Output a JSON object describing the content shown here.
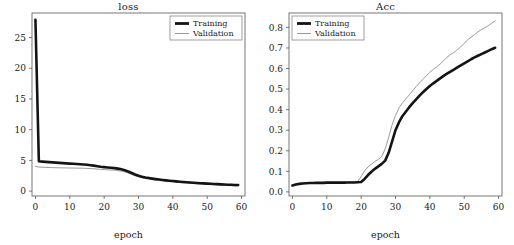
{
  "figure": {
    "width": 514,
    "height": 245,
    "background": "#ffffff",
    "panels": 2
  },
  "colors": {
    "training": "#141414",
    "validation": "#8e8e8e",
    "frame": "#555555",
    "text": "#1a1a1a",
    "background": "#ffffff"
  },
  "legend": {
    "training_label": "Training",
    "validation_label": "Validation"
  },
  "chart_data": [
    {
      "type": "line",
      "title": "loss",
      "xlabel": "epoch",
      "ylabel": "",
      "xlim": [
        -1,
        61
      ],
      "ylim": [
        -0.8,
        29
      ],
      "grid": false,
      "legend_position": "top-right",
      "xticks": [
        0,
        10,
        20,
        30,
        40,
        50,
        60
      ],
      "xticklabels": [
        "0",
        "10",
        "20",
        "30",
        "40",
        "50",
        "60"
      ],
      "yticks": [
        0,
        5,
        10,
        15,
        20,
        25
      ],
      "yticklabels": [
        "0",
        "5",
        "10",
        "15",
        "20",
        "25"
      ],
      "x": [
        0,
        1,
        2,
        3,
        4,
        5,
        6,
        7,
        8,
        9,
        10,
        11,
        12,
        13,
        14,
        15,
        16,
        17,
        18,
        19,
        20,
        21,
        22,
        23,
        24,
        25,
        26,
        27,
        28,
        29,
        30,
        31,
        32,
        33,
        34,
        35,
        36,
        37,
        38,
        39,
        40,
        41,
        42,
        43,
        44,
        45,
        46,
        47,
        48,
        49,
        50,
        51,
        52,
        53,
        54,
        55,
        56,
        57,
        58,
        59
      ],
      "series": [
        {
          "name": "Training",
          "color": "#141414",
          "values": [
            27.9,
            4.85,
            4.8,
            4.76,
            4.72,
            4.68,
            4.64,
            4.6,
            4.56,
            4.52,
            4.48,
            4.44,
            4.4,
            4.36,
            4.32,
            4.28,
            4.22,
            4.15,
            4.05,
            3.95,
            3.9,
            3.85,
            3.8,
            3.74,
            3.66,
            3.55,
            3.4,
            3.2,
            2.95,
            2.7,
            2.5,
            2.34,
            2.22,
            2.12,
            2.03,
            1.95,
            1.88,
            1.81,
            1.75,
            1.69,
            1.63,
            1.58,
            1.53,
            1.48,
            1.44,
            1.4,
            1.36,
            1.32,
            1.28,
            1.25,
            1.22,
            1.19,
            1.16,
            1.13,
            1.1,
            1.07,
            1.04,
            1.02,
            1.0,
            0.98
          ]
        },
        {
          "name": "Validation",
          "color": "#8e8e8e",
          "values": [
            4.0,
            3.92,
            3.88,
            3.86,
            3.84,
            3.82,
            3.8,
            3.79,
            3.78,
            3.77,
            3.76,
            3.75,
            3.74,
            3.73,
            3.72,
            3.7,
            3.67,
            3.63,
            3.58,
            3.53,
            3.5,
            3.47,
            3.44,
            3.4,
            3.34,
            3.25,
            3.12,
            2.94,
            2.72,
            2.5,
            2.32,
            2.17,
            2.06,
            1.96,
            1.88,
            1.8,
            1.73,
            1.67,
            1.61,
            1.55,
            1.5,
            1.45,
            1.4,
            1.35,
            1.31,
            1.27,
            1.23,
            1.19,
            1.15,
            1.12,
            1.09,
            1.06,
            1.03,
            1.0,
            0.97,
            0.94,
            0.91,
            0.88,
            0.85,
            0.82
          ]
        }
      ]
    },
    {
      "type": "line",
      "title": "Acc",
      "xlabel": "epoch",
      "ylabel": "",
      "xlim": [
        -1,
        61
      ],
      "ylim": [
        -0.02,
        0.87
      ],
      "grid": false,
      "legend_position": "top-left",
      "xticks": [
        0,
        10,
        20,
        30,
        40,
        50,
        60
      ],
      "xticklabels": [
        "0",
        "10",
        "20",
        "30",
        "40",
        "50",
        "60"
      ],
      "yticks": [
        0.0,
        0.1,
        0.2,
        0.3,
        0.4,
        0.5,
        0.6,
        0.7,
        0.8
      ],
      "yticklabels": [
        "0.0",
        "0.1",
        "0.2",
        "0.3",
        "0.4",
        "0.5",
        "0.6",
        "0.7",
        "0.8"
      ],
      "x": [
        0,
        1,
        2,
        3,
        4,
        5,
        6,
        7,
        8,
        9,
        10,
        11,
        12,
        13,
        14,
        15,
        16,
        17,
        18,
        19,
        20,
        21,
        22,
        23,
        24,
        25,
        26,
        27,
        28,
        29,
        30,
        31,
        32,
        33,
        34,
        35,
        36,
        37,
        38,
        39,
        40,
        41,
        42,
        43,
        44,
        45,
        46,
        47,
        48,
        49,
        50,
        51,
        52,
        53,
        54,
        55,
        56,
        57,
        58,
        59
      ],
      "series": [
        {
          "name": "Training",
          "color": "#141414",
          "values": [
            0.031,
            0.036,
            0.039,
            0.041,
            0.042,
            0.043,
            0.043,
            0.044,
            0.044,
            0.044,
            0.045,
            0.045,
            0.045,
            0.045,
            0.045,
            0.045,
            0.046,
            0.046,
            0.046,
            0.047,
            0.048,
            0.063,
            0.082,
            0.098,
            0.112,
            0.124,
            0.136,
            0.152,
            0.19,
            0.245,
            0.3,
            0.338,
            0.368,
            0.39,
            0.412,
            0.432,
            0.45,
            0.468,
            0.485,
            0.5,
            0.515,
            0.528,
            0.54,
            0.552,
            0.564,
            0.575,
            0.585,
            0.595,
            0.605,
            0.615,
            0.625,
            0.635,
            0.645,
            0.654,
            0.662,
            0.67,
            0.678,
            0.686,
            0.694,
            0.701
          ]
        },
        {
          "name": "Validation",
          "color": "#8e8e8e",
          "values": [
            0.033,
            0.038,
            0.041,
            0.043,
            0.044,
            0.045,
            0.045,
            0.046,
            0.046,
            0.046,
            0.047,
            0.047,
            0.047,
            0.047,
            0.047,
            0.047,
            0.048,
            0.048,
            0.048,
            0.05,
            0.075,
            0.102,
            0.122,
            0.135,
            0.148,
            0.158,
            0.172,
            0.21,
            0.265,
            0.325,
            0.372,
            0.408,
            0.432,
            0.452,
            0.472,
            0.492,
            0.512,
            0.53,
            0.548,
            0.565,
            0.582,
            0.596,
            0.608,
            0.622,
            0.638,
            0.655,
            0.668,
            0.678,
            0.692,
            0.705,
            0.722,
            0.74,
            0.752,
            0.765,
            0.778,
            0.79,
            0.798,
            0.808,
            0.82,
            0.832
          ]
        }
      ]
    }
  ]
}
